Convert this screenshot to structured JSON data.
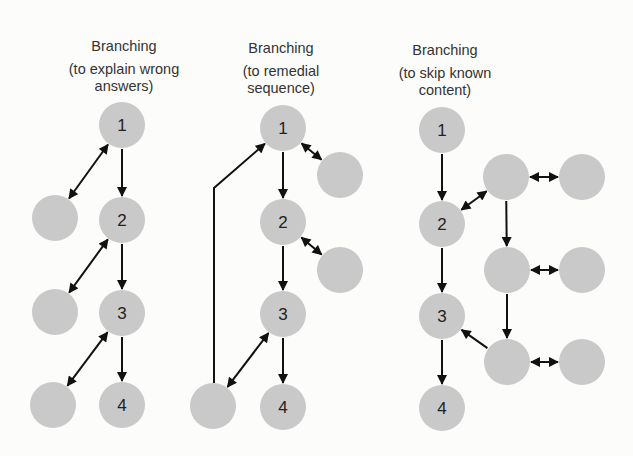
{
  "diagram": {
    "colors": {
      "node_fill": "#c9c9c9",
      "arrow": "#111111",
      "background": "#fcfcfb"
    },
    "node_radius": 23,
    "panels": [
      {
        "id": "explain-wrong-answers",
        "title": "Branching",
        "subtitle_line1": "(to explain wrong",
        "subtitle_line2": "answers)",
        "title_x": 124,
        "title_y": 38,
        "nodes": [
          {
            "id": "p1n1",
            "x": 122,
            "y": 125,
            "label": "1"
          },
          {
            "id": "p1n2",
            "x": 122,
            "y": 220,
            "label": "2"
          },
          {
            "id": "p1n3",
            "x": 122,
            "y": 313,
            "label": "3"
          },
          {
            "id": "p1n4",
            "x": 122,
            "y": 405,
            "label": "4"
          },
          {
            "id": "p1a",
            "x": 55,
            "y": 218,
            "label": ""
          },
          {
            "id": "p1b",
            "x": 55,
            "y": 312,
            "label": ""
          },
          {
            "id": "p1c",
            "x": 53,
            "y": 405,
            "label": ""
          }
        ],
        "edges": [
          {
            "from": "p1n1",
            "to": "p1n2",
            "type": "single"
          },
          {
            "from": "p1n2",
            "to": "p1n3",
            "type": "single"
          },
          {
            "from": "p1n3",
            "to": "p1n4",
            "type": "single"
          },
          {
            "from": "p1n1",
            "to": "p1a",
            "type": "double"
          },
          {
            "from": "p1n2",
            "to": "p1b",
            "type": "double"
          },
          {
            "from": "p1n3",
            "to": "p1c",
            "type": "double"
          }
        ]
      },
      {
        "id": "remedial-sequence",
        "title": "Branching",
        "subtitle_line1": "(to remedial",
        "subtitle_line2": "sequence)",
        "title_x": 281,
        "title_y": 40,
        "nodes": [
          {
            "id": "p2n1",
            "x": 283,
            "y": 128,
            "label": "1"
          },
          {
            "id": "p2n2",
            "x": 283,
            "y": 222,
            "label": "2"
          },
          {
            "id": "p2n3",
            "x": 283,
            "y": 314,
            "label": "3"
          },
          {
            "id": "p2n4",
            "x": 283,
            "y": 407,
            "label": "4"
          },
          {
            "id": "p2a",
            "x": 340,
            "y": 175,
            "label": ""
          },
          {
            "id": "p2b",
            "x": 340,
            "y": 270,
            "label": ""
          },
          {
            "id": "p2c",
            "x": 213,
            "y": 406,
            "label": ""
          }
        ],
        "edges": [
          {
            "from": "p2n1",
            "to": "p2n2",
            "type": "single"
          },
          {
            "from": "p2n2",
            "to": "p2n3",
            "type": "single"
          },
          {
            "from": "p2n3",
            "to": "p2n4",
            "type": "single"
          },
          {
            "from": "p2n1",
            "to": "p2a",
            "type": "double"
          },
          {
            "from": "p2n2",
            "to": "p2b",
            "type": "double"
          },
          {
            "from": "p2n3",
            "to": "p2c",
            "type": "double"
          },
          {
            "from": "p2c",
            "to": "p2n1",
            "type": "remedial-loop"
          }
        ]
      },
      {
        "id": "skip-known-content",
        "title": "Branching",
        "subtitle_line1": "(to skip known",
        "subtitle_line2": "content)",
        "title_x": 445,
        "title_y": 42,
        "nodes": [
          {
            "id": "p3n1",
            "x": 442,
            "y": 130,
            "label": "1"
          },
          {
            "id": "p3n2",
            "x": 442,
            "y": 224,
            "label": "2"
          },
          {
            "id": "p3n3",
            "x": 442,
            "y": 316,
            "label": "3"
          },
          {
            "id": "p3n4",
            "x": 442,
            "y": 408,
            "label": "4"
          },
          {
            "id": "p3m1",
            "x": 506,
            "y": 177,
            "label": ""
          },
          {
            "id": "p3m2",
            "x": 507,
            "y": 270,
            "label": ""
          },
          {
            "id": "p3m3",
            "x": 507,
            "y": 362,
            "label": ""
          },
          {
            "id": "p3r1",
            "x": 582,
            "y": 177,
            "label": ""
          },
          {
            "id": "p3r2",
            "x": 582,
            "y": 270,
            "label": ""
          },
          {
            "id": "p3r3",
            "x": 582,
            "y": 362,
            "label": ""
          }
        ],
        "edges": [
          {
            "from": "p3n1",
            "to": "p3n2",
            "type": "single"
          },
          {
            "from": "p3n2",
            "to": "p3n3",
            "type": "single"
          },
          {
            "from": "p3n3",
            "to": "p3n4",
            "type": "single"
          },
          {
            "from": "p3n2",
            "to": "p3m1",
            "type": "double"
          },
          {
            "from": "p3m1",
            "to": "p3m2",
            "type": "single"
          },
          {
            "from": "p3m2",
            "to": "p3m3",
            "type": "single"
          },
          {
            "from": "p3m3",
            "to": "p3n3",
            "type": "single"
          },
          {
            "from": "p3m1",
            "to": "p3r1",
            "type": "double"
          },
          {
            "from": "p3m2",
            "to": "p3r2",
            "type": "double"
          },
          {
            "from": "p3m3",
            "to": "p3r3",
            "type": "double"
          }
        ]
      }
    ]
  }
}
